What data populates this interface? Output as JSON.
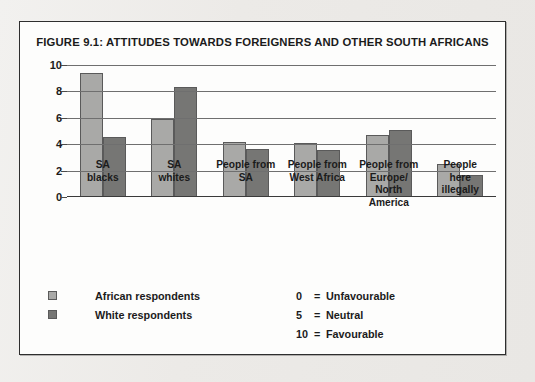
{
  "figure": {
    "title": "FIGURE 9.1: ATTITUDES TOWARDS FOREIGNERS AND OTHER SOUTH AFRICANS"
  },
  "legend": {
    "items": [
      {
        "label": "African respondents",
        "color": "#a9a9a7"
      },
      {
        "label": "White respondents",
        "color": "#767674"
      }
    ]
  },
  "scale_key": [
    {
      "value": "0",
      "eq": "=",
      "meaning": "Unfavourable"
    },
    {
      "value": "5",
      "eq": "=",
      "meaning": "Neutral"
    },
    {
      "value": "10",
      "eq": "=",
      "meaning": "Favourable"
    }
  ],
  "chart_data": {
    "type": "bar",
    "title": "FIGURE 9.1: ATTITUDES TOWARDS FOREIGNERS AND OTHER SOUTH AFRICANS",
    "xlabel": "",
    "ylabel": "",
    "ylim": [
      0,
      10
    ],
    "yticks": [
      0,
      2,
      4,
      6,
      8,
      10
    ],
    "grid": true,
    "legend_position": "bottom-left",
    "categories": [
      "SA blacks",
      "SA whites",
      "People from SA",
      "People from West Africa",
      "People from Europe/ North America",
      "People here illegally"
    ],
    "category_lines": [
      [
        "SA",
        "blacks"
      ],
      [
        "SA",
        "whites"
      ],
      [
        "People from",
        "SA"
      ],
      [
        "People from",
        "West Africa"
      ],
      [
        "People from",
        "Europe/",
        "North America"
      ],
      [
        "People",
        "here",
        "illegally"
      ]
    ],
    "series": [
      {
        "name": "African respondents",
        "color": "#a9a9a7",
        "values": [
          9.4,
          5.9,
          4.1,
          4.0,
          4.6,
          2.4
        ]
      },
      {
        "name": "White respondents",
        "color": "#767674",
        "values": [
          4.5,
          8.3,
          3.6,
          3.5,
          5.0,
          1.6
        ]
      }
    ],
    "annotations": [
      "0 = Unfavourable",
      "5 = Neutral",
      "10 = Favourable"
    ]
  }
}
